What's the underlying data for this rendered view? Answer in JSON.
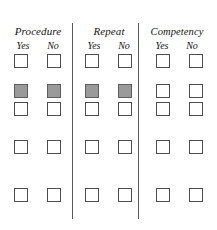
{
  "form": {
    "title": "Procedure / Repeat / Competency checklist",
    "background_color": "#ffffff",
    "divider_color": "#5a5a5a",
    "checkbox_border_color": "#4d4d4d",
    "checkbox_fill_color": "#9a9a9a"
  },
  "columns": [
    {
      "id": "procedure",
      "title": "Procedure",
      "subheaders": [
        "Yes",
        "No"
      ]
    },
    {
      "id": "repeat",
      "title": "Repeat",
      "subheaders": [
        "Yes",
        "No"
      ]
    },
    {
      "id": "competency",
      "title": "Competency",
      "subheaders": [
        "Yes",
        "No"
      ]
    }
  ],
  "rows": [
    {
      "index": 1,
      "top": 0,
      "cells": [
        {
          "column": "procedure",
          "option": "Yes",
          "checked": false
        },
        {
          "column": "procedure",
          "option": "No",
          "checked": false
        },
        {
          "column": "repeat",
          "option": "Yes",
          "checked": false
        },
        {
          "column": "repeat",
          "option": "No",
          "checked": false
        },
        {
          "column": "competency",
          "option": "Yes",
          "checked": false
        },
        {
          "column": "competency",
          "option": "No",
          "checked": false
        }
      ]
    },
    {
      "index": 2,
      "top": 30,
      "cells": [
        {
          "column": "procedure",
          "option": "Yes",
          "checked": true
        },
        {
          "column": "procedure",
          "option": "No",
          "checked": true
        },
        {
          "column": "repeat",
          "option": "Yes",
          "checked": true
        },
        {
          "column": "repeat",
          "option": "No",
          "checked": true
        },
        {
          "column": "competency",
          "option": "Yes",
          "checked": false
        },
        {
          "column": "competency",
          "option": "No",
          "checked": false
        }
      ]
    },
    {
      "index": 3,
      "top": 48,
      "cells": [
        {
          "column": "procedure",
          "option": "Yes",
          "checked": false
        },
        {
          "column": "procedure",
          "option": "No",
          "checked": false
        },
        {
          "column": "repeat",
          "option": "Yes",
          "checked": false
        },
        {
          "column": "repeat",
          "option": "No",
          "checked": false
        },
        {
          "column": "competency",
          "option": "Yes",
          "checked": false
        },
        {
          "column": "competency",
          "option": "No",
          "checked": false
        }
      ]
    },
    {
      "index": 4,
      "top": 86,
      "cells": [
        {
          "column": "procedure",
          "option": "Yes",
          "checked": false
        },
        {
          "column": "procedure",
          "option": "No",
          "checked": false
        },
        {
          "column": "repeat",
          "option": "Yes",
          "checked": false
        },
        {
          "column": "repeat",
          "option": "No",
          "checked": false
        },
        {
          "column": "competency",
          "option": "Yes",
          "checked": false
        },
        {
          "column": "competency",
          "option": "No",
          "checked": false
        }
      ]
    },
    {
      "index": 5,
      "top": 134,
      "cells": [
        {
          "column": "procedure",
          "option": "Yes",
          "checked": false
        },
        {
          "column": "procedure",
          "option": "No",
          "checked": false
        },
        {
          "column": "repeat",
          "option": "Yes",
          "checked": false
        },
        {
          "column": "repeat",
          "option": "No",
          "checked": false
        },
        {
          "column": "competency",
          "option": "Yes",
          "checked": false
        },
        {
          "column": "competency",
          "option": "No",
          "checked": false
        }
      ]
    }
  ],
  "cell_x_positions": [
    14,
    47,
    85,
    118,
    156,
    189
  ]
}
